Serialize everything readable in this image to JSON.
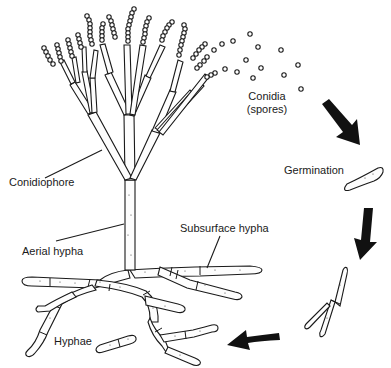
{
  "diagram": {
    "labels": {
      "conidia_line1": "Conidia",
      "conidia_line2": "(spores)",
      "germination": "Germination",
      "conidiophore": "Conidiophore",
      "aerial_hypha": "Aerial hypha",
      "subsurface_hypha": "Subsurface hypha",
      "hyphae": "Hyphae"
    },
    "cycle_arrows": [
      {
        "from": "conidia",
        "to": "germination"
      },
      {
        "from": "germination",
        "to": "germinating spore"
      },
      {
        "from": "germinating spore",
        "to": "hyphae"
      }
    ],
    "colors": {
      "line": "#1a1a1a",
      "background": "#ffffff",
      "arrow": "#111111"
    }
  }
}
